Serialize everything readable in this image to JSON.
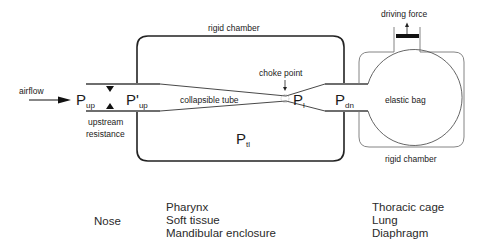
{
  "diagram": {
    "labels": {
      "airflow": "airflow",
      "rigid_chamber_top": "rigid chamber",
      "rigid_chamber_right": "rigid chamber",
      "choke_point": "choke point",
      "collapsible_tube": "collapsible tube",
      "driving_force": "driving force",
      "elastic_bag": "elastic bag",
      "upstream_resistance_line1": "upstream",
      "upstream_resistance_line2": "resistance"
    },
    "pressures": {
      "p_up": {
        "main": "P",
        "sub": "up"
      },
      "p_up_prime": {
        "main": "P'",
        "sub": "up"
      },
      "p_l": {
        "main": "P",
        "sub": "l"
      },
      "p_dn": {
        "main": "P",
        "sub": "dn"
      },
      "p_tl": {
        "main": "P",
        "sub": "tl"
      }
    },
    "anatomy": {
      "upstream": [
        "Nose"
      ],
      "collapsible": [
        "Pharynx",
        "Soft tissue",
        "Mandibular enclosure"
      ],
      "driving": [
        "Thoracic cage",
        "Lung",
        "Diaphragm"
      ]
    },
    "colors": {
      "stroke_dark": "#222222",
      "stroke_grey": "#7a7a7a",
      "piston": "#111111"
    }
  }
}
